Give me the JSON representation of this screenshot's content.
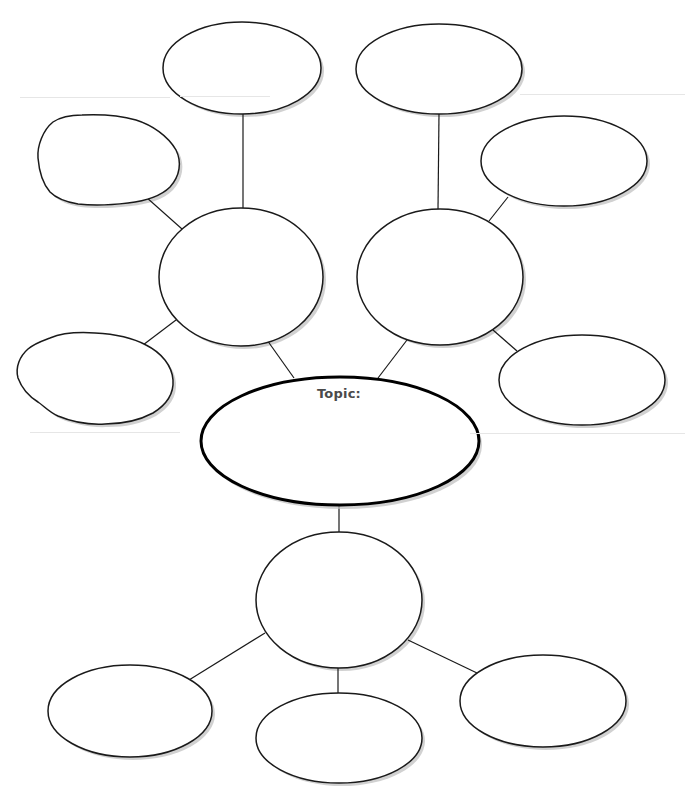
{
  "diagram": {
    "type": "web-graphic-organizer",
    "stroke_color": "#1a1a1a",
    "topic_stroke_color": "#000000",
    "shadow_color": "#bdbdbd",
    "fill_color": "#ffffff",
    "text_color": "#4a4a4a",
    "topic": {
      "label": "Topic:",
      "cx": 340,
      "cy": 441,
      "rx": 139,
      "ry": 64,
      "label_x": 339,
      "label_y": 386
    },
    "nodes": [
      {
        "id": "top-left-oval",
        "shape": "ellipse",
        "cx": 242,
        "cy": 68,
        "rx": 79,
        "ry": 46,
        "text": ""
      },
      {
        "id": "top-right-oval",
        "shape": "ellipse",
        "cx": 439,
        "cy": 69,
        "rx": 83,
        "ry": 45,
        "text": ""
      },
      {
        "id": "upper-left-blob",
        "shape": "blob",
        "path": "M53,122 C62,116 72,115 82,115 C104,114 122,116 136,120 C152,125 168,136 176,150 C182,162 180,176 170,187 C160,197 145,201 128,203 C112,205 94,206 78,204 C66,202 57,199 50,192 C43,184 39,170 38,158 C37,146 43,130 53,122 Z",
        "text": ""
      },
      {
        "id": "upper-right-oval",
        "shape": "ellipse",
        "cx": 564,
        "cy": 161,
        "rx": 83,
        "ry": 45,
        "text": ""
      },
      {
        "id": "left-hub-circle",
        "shape": "ellipse",
        "cx": 241,
        "cy": 277,
        "rx": 82,
        "ry": 69,
        "text": ""
      },
      {
        "id": "right-hub-circle",
        "shape": "ellipse",
        "cx": 440,
        "cy": 277,
        "rx": 83,
        "ry": 68,
        "text": ""
      },
      {
        "id": "lower-left-blob",
        "shape": "blob",
        "path": "M50,338 C62,333 80,332 95,333 C115,334 133,338 146,345 C162,353 172,366 173,380 C174,394 166,405 153,413 C138,421 122,424 105,424 C88,425 70,421 58,416 C49,412 44,406 38,402 C30,397 22,389 18,378 C15,367 20,356 28,349 C35,343 42,341 50,338 Z",
        "text": ""
      },
      {
        "id": "lower-right-oval",
        "shape": "ellipse",
        "cx": 582,
        "cy": 380,
        "rx": 83,
        "ry": 45,
        "text": ""
      },
      {
        "id": "bottom-hub-circle",
        "shape": "ellipse",
        "cx": 339,
        "cy": 600,
        "rx": 83,
        "ry": 68,
        "text": ""
      },
      {
        "id": "bottom-left-oval",
        "shape": "ellipse",
        "cx": 130,
        "cy": 711,
        "rx": 82,
        "ry": 46,
        "text": ""
      },
      {
        "id": "bottom-middle-oval",
        "shape": "ellipse",
        "cx": 339,
        "cy": 738,
        "rx": 83,
        "ry": 45,
        "text": ""
      },
      {
        "id": "bottom-right-oval",
        "shape": "ellipse",
        "cx": 543,
        "cy": 701,
        "rx": 83,
        "ry": 46,
        "text": ""
      }
    ],
    "connectors": [
      {
        "id": "top-left-to-left-hub",
        "x1": 243,
        "y1": 113,
        "x2": 243,
        "y2": 208
      },
      {
        "id": "upper-left-to-left-hub",
        "x1": 146,
        "y1": 197,
        "x2": 182,
        "y2": 229
      },
      {
        "id": "lower-left-to-left-hub",
        "x1": 143,
        "y1": 345,
        "x2": 176,
        "y2": 320
      },
      {
        "id": "left-hub-to-topic",
        "x1": 267,
        "y1": 340,
        "x2": 294,
        "y2": 378
      },
      {
        "id": "top-right-to-right-hub",
        "x1": 439,
        "y1": 113,
        "x2": 438,
        "y2": 209
      },
      {
        "id": "upper-right-to-right-hub",
        "x1": 508,
        "y1": 197,
        "x2": 489,
        "y2": 221
      },
      {
        "id": "lower-right-to-right-hub",
        "x1": 493,
        "y1": 330,
        "x2": 517,
        "y2": 351
      },
      {
        "id": "right-hub-to-topic",
        "x1": 407,
        "y1": 340,
        "x2": 378,
        "y2": 378
      },
      {
        "id": "topic-to-bottom-hub",
        "x1": 339,
        "y1": 505,
        "x2": 339,
        "y2": 532
      },
      {
        "id": "bottom-hub-to-bottom-left",
        "x1": 265,
        "y1": 633,
        "x2": 189,
        "y2": 680
      },
      {
        "id": "bottom-hub-to-bottom-middle",
        "x1": 338,
        "y1": 668,
        "x2": 338,
        "y2": 693
      },
      {
        "id": "bottom-hub-to-bottom-right",
        "x1": 408,
        "y1": 640,
        "x2": 477,
        "y2": 673
      }
    ],
    "scan_lines": [
      {
        "x": 20,
        "y": 97,
        "w": 150
      },
      {
        "x": 180,
        "y": 96,
        "w": 90
      },
      {
        "x": 520,
        "y": 94,
        "w": 165
      },
      {
        "x": 30,
        "y": 432,
        "w": 150
      },
      {
        "x": 470,
        "y": 433,
        "w": 215
      }
    ]
  }
}
